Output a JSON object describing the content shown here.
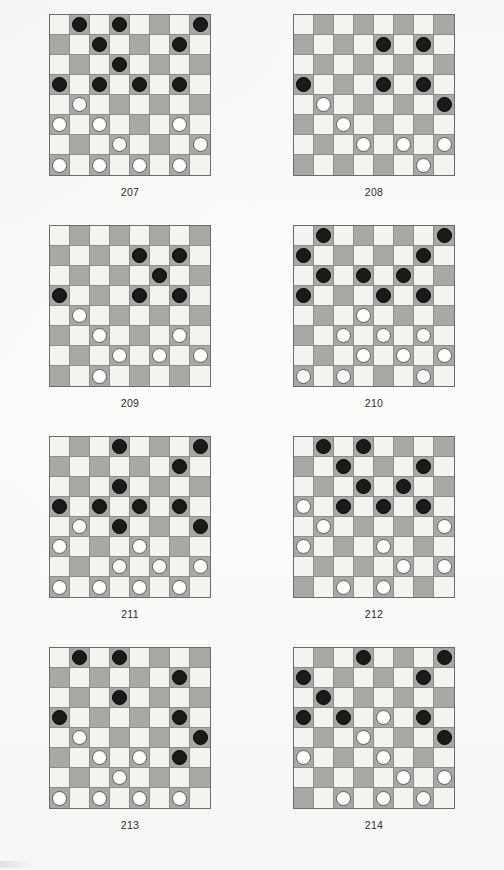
{
  "page": {
    "type": "checkers-problem-sheet",
    "board_size": 8,
    "colors": {
      "light_square": "#f4f3f0",
      "dark_square": "#a9a8a4",
      "black_piece": "#1a1a1a",
      "white_piece": "#fdfdfc",
      "board_border": "#6c6c6c",
      "paper": "#f8f8f7",
      "caption_text": "#2b2b2b"
    },
    "legend": {
      "b": "black-piece",
      "w": "white-piece",
      ".": "empty-square"
    }
  },
  "diagrams": [
    {
      "id": "diagram-207",
      "caption": "207",
      "rows": [
        ".b.b...b",
        "..b...b.",
        "...b....",
        "b.b.b.b.",
        ".w......",
        "w.w...w.",
        "...w...w",
        "w.w.w.w."
      ]
    },
    {
      "id": "diagram-208",
      "caption": "208",
      "rows": [
        "........",
        "....b.b.",
        "........",
        "b...b.b.",
        ".w.....b",
        "..w.....",
        "...w.w.w",
        "......w."
      ]
    },
    {
      "id": "diagram-209",
      "caption": "209",
      "rows": [
        "........",
        "....b.b.",
        ".....b..",
        "b...b.b.",
        ".w......",
        "..w...w.",
        "...w.w.w",
        "..w....."
      ]
    },
    {
      "id": "diagram-210",
      "caption": "210",
      "rows": [
        ".b.....b",
        "b.....b.",
        ".b.b.b..",
        "b...b.b.",
        "...w....",
        "..w.w.w.",
        "...w.w.w",
        "w.w...w."
      ]
    },
    {
      "id": "diagram-211",
      "caption": "211",
      "rows": [
        "...b...b",
        "......b.",
        "...b....",
        "b.b.b.b.",
        ".w.b...b",
        "w...w...",
        "...w.w.w",
        "w.w.w.w."
      ]
    },
    {
      "id": "diagram-212",
      "caption": "212",
      "rows": [
        ".b.b....",
        "..b...b.",
        "...b.b..",
        "w.b.b.b.",
        ".w.....w",
        "w...w...",
        ".....w.w",
        "..w.w..."
      ]
    },
    {
      "id": "diagram-213",
      "caption": "213",
      "rows": [
        ".b.b....",
        "......b.",
        "...b....",
        "b.....b.",
        ".w.....b",
        "..w.w.b.",
        "...w....",
        "w.w.w.w."
      ]
    },
    {
      "id": "diagram-214",
      "caption": "214",
      "rows": [
        "...b...b",
        "b.....b.",
        ".b......",
        "b.b.w.b.",
        "...w...b",
        "w...w...",
        ".....w.w",
        "..w.w.w."
      ]
    }
  ]
}
